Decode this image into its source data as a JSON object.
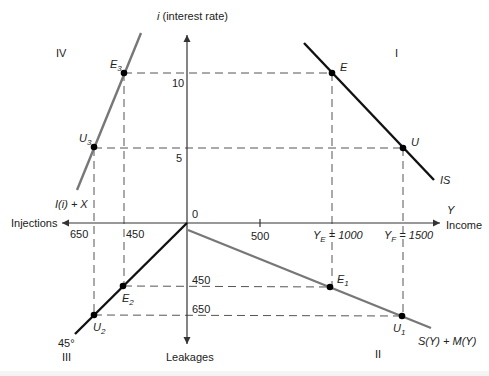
{
  "diagram": {
    "axes": {
      "vertical_top_label": "i (interest rate)",
      "vertical_top_label_italic_part": "i",
      "vertical_top_label_rest": " (interest rate)",
      "vertical_bottom_label": "Leakages",
      "horizontal_right_label_top": "Y",
      "horizontal_right_label": "Income",
      "horizontal_left_label": "Injections",
      "origin_label": "0"
    },
    "quadrants": {
      "q1": "I",
      "q2": "II",
      "q3": "III",
      "q4": "IV"
    },
    "ticks": {
      "i_10": "10",
      "i_5": "5",
      "income_500": "500",
      "income_YE": "Y",
      "income_YE_sub": "E",
      "income_YE_val": " = 1000",
      "income_YF": "Y",
      "income_YF_sub": "F",
      "income_YF_val": " = 1500",
      "injections_650": "650",
      "injections_450": "450",
      "leakages_450": "450",
      "leakages_650": "650"
    },
    "curves": {
      "IS": "IS",
      "investment_exports": "I(i) + X",
      "savings_imports": "S(Y) + M(Y)",
      "angle_45": "45°"
    },
    "points": {
      "E": "E",
      "U": "U",
      "E1": "E",
      "E1_sub": "1",
      "U1": "U",
      "U1_sub": "1",
      "E2": "E",
      "E2_sub": "2",
      "U2": "U",
      "U2_sub": "2",
      "E3": "E",
      "E3_sub": "3",
      "U3": "U",
      "U3_sub": "3"
    },
    "colors": {
      "axis": "#333333",
      "is_line": "#111111",
      "grey_line": "#777777",
      "dashed": "#555555",
      "point": "#000000"
    }
  }
}
